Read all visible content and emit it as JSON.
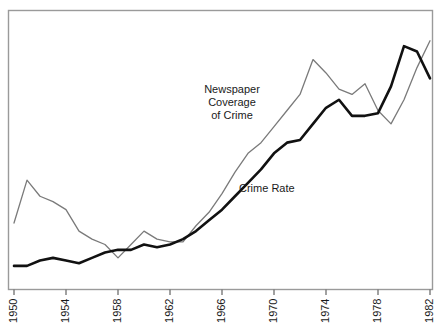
{
  "figure": {
    "background_color": "#ffffff",
    "frame_color": "#9a9a9a",
    "width": 443,
    "height": 331
  },
  "annotations": {
    "newspaper_label_line1": "Newspaper",
    "newspaper_label_line2": "Coverage",
    "newspaper_label_line3": "of Crime",
    "crime_rate_label": "Crime Rate"
  },
  "axis": {
    "x_tick_labels": [
      "1950",
      "1954",
      "1958",
      "1962",
      "1966",
      "1970",
      "1974",
      "1978",
      "1982"
    ],
    "x_tick_values": [
      1950,
      1954,
      1958,
      1962,
      1966,
      1970,
      1974,
      1978,
      1982
    ],
    "x_tick_rotation": "-90",
    "y_tick_labels": []
  },
  "chart_data": {
    "type": "line",
    "title": "",
    "subtitle": "",
    "xlabel": "",
    "ylabel": "",
    "xlim": [
      1950,
      1982
    ],
    "ylim": [
      0,
      100
    ],
    "grid": false,
    "legend_position": "inline-annotation",
    "x": [
      1950,
      1951,
      1952,
      1953,
      1954,
      1955,
      1956,
      1957,
      1958,
      1959,
      1960,
      1961,
      1962,
      1963,
      1964,
      1965,
      1966,
      1967,
      1968,
      1969,
      1970,
      1971,
      1972,
      1973,
      1974,
      1975,
      1976,
      1977,
      1978,
      1979,
      1980,
      1981,
      1982
    ],
    "series": [
      {
        "name": "Newspaper Coverage of Crime",
        "color": "#7a7a7a",
        "line_width": 1.3,
        "values": [
          22,
          38,
          32,
          30,
          27,
          19,
          16,
          14,
          9,
          14,
          19,
          16,
          15,
          15,
          21,
          26,
          33,
          41,
          48,
          52,
          58,
          64,
          70,
          83,
          78,
          72,
          70,
          74,
          64,
          59,
          68,
          80,
          90
        ]
      },
      {
        "name": "Crime Rate",
        "color": "#111111",
        "line_width": 2.6,
        "values": [
          6,
          6,
          8,
          9,
          8,
          7,
          9,
          11,
          12,
          12,
          14,
          13,
          14,
          16,
          19,
          23,
          27,
          32,
          37,
          42,
          48,
          52,
          53,
          59,
          65,
          68,
          62,
          62,
          63,
          73,
          88,
          86,
          76
        ]
      }
    ],
    "annotations": [
      {
        "text": "Newspaper Coverage of Crime",
        "x": 1966,
        "y": 70
      },
      {
        "text": "Crime Rate",
        "x": 1970,
        "y": 42
      }
    ]
  }
}
